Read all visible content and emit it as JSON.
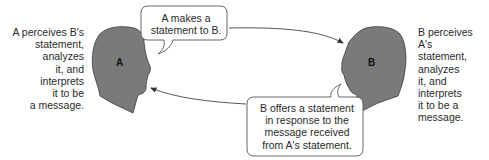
{
  "diagram": {
    "person_a": {
      "letter": "A",
      "description_lines": [
        "A perceives B's",
        "statement,",
        "analyzes",
        "it, and",
        "interprets",
        "it to be",
        "a message."
      ]
    },
    "person_b": {
      "letter": "B",
      "description_lines": [
        "B perceives A's",
        "statement,",
        "analyzes",
        "it, and",
        "interprets",
        "it to be a",
        "message."
      ]
    },
    "bubble_a": {
      "lines": [
        "A makes a",
        "statement to B."
      ]
    },
    "bubble_b": {
      "lines": [
        "B offers a statement",
        "in response to the",
        "message received",
        "from A's statement."
      ]
    },
    "colors": {
      "head_fill": "#7a7a7a",
      "head_stroke": "#3a3a3a",
      "bubble_stroke": "#555555",
      "arrow": "#444444"
    }
  }
}
